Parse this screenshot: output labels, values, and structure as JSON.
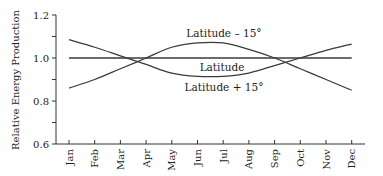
{
  "chart_data": {
    "type": "line",
    "title": "",
    "xlabel": "",
    "ylabel": "Relative Energy Production",
    "categories": [
      "Jan",
      "Feb",
      "Mar",
      "Apr",
      "May",
      "Jun",
      "Jul",
      "Aug",
      "Sep",
      "Oct",
      "Nov",
      "Dec"
    ],
    "ylim": [
      0.6,
      1.2
    ],
    "yticks": [
      0.6,
      0.8,
      1.0,
      1.2
    ],
    "ytick_labels": [
      "0.6",
      "0.8",
      "1.0",
      "1.2"
    ],
    "grid": false,
    "legend": "inline labels",
    "series": [
      {
        "name": "Latitude – 15°",
        "values": [
          0.86,
          0.9,
          0.95,
          1.0,
          1.05,
          1.07,
          1.07,
          1.04,
          1.0,
          0.95,
          0.9,
          0.85
        ]
      },
      {
        "name": "Latitude",
        "values": [
          1.0,
          1.0,
          1.0,
          1.0,
          1.0,
          1.0,
          1.0,
          1.0,
          1.0,
          1.0,
          1.0,
          1.0
        ]
      },
      {
        "name": "Latitude + 15°",
        "values": [
          1.085,
          1.05,
          1.01,
          0.97,
          0.93,
          0.915,
          0.915,
          0.93,
          0.965,
          1.0,
          1.035,
          1.065
        ]
      }
    ],
    "annotations": [
      {
        "text": "Latitude – 15°",
        "near": "Jun"
      },
      {
        "text": "Latitude",
        "near": "Jun"
      },
      {
        "text": "Latitude + 15°",
        "near": "Jun"
      }
    ]
  }
}
